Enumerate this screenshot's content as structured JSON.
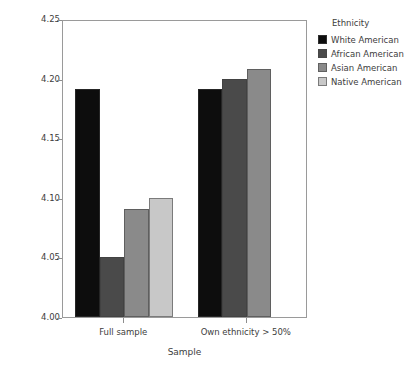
{
  "chart_data": {
    "type": "bar",
    "title": "",
    "xlabel": "Sample",
    "ylabel": "Mean life satisfaction",
    "categories": [
      "Full sample",
      "Own ethnicity > 50%"
    ],
    "ylim": [
      4.0,
      4.25
    ],
    "yticks": [
      "4.00",
      "4.05",
      "4.10",
      "4.15",
      "4.20",
      "4.25"
    ],
    "ytick_values": [
      4.0,
      4.05,
      4.1,
      4.15,
      4.2,
      4.25
    ],
    "grid": false,
    "legend_position": "right",
    "legend_title": "Ethnicity",
    "series": [
      {
        "name": "White American",
        "color": "#0d0d0d",
        "values": [
          4.191,
          4.191
        ]
      },
      {
        "name": "African American",
        "color": "#4a4a4a",
        "values": [
          4.05,
          4.2
        ]
      },
      {
        "name": "Asian American",
        "color": "#8a8a8a",
        "values": [
          4.091,
          4.208
        ]
      },
      {
        "name": "Native American",
        "color": "#c8c8c8",
        "values": [
          4.1,
          null
        ]
      }
    ]
  },
  "axes": {
    "y_title": "Mean life satisfaction",
    "x_title": "Sample",
    "y_ticks": [
      {
        "label": "4.25",
        "value": 4.25
      },
      {
        "label": "4.20",
        "value": 4.2
      },
      {
        "label": "4.15",
        "value": 4.15
      },
      {
        "label": "4.10",
        "value": 4.1
      },
      {
        "label": "4.05",
        "value": 4.05
      },
      {
        "label": "4.00",
        "value": 4.0
      }
    ],
    "x_ticks": [
      {
        "label": "Full sample"
      },
      {
        "label": "Own ethnicity > 50%"
      }
    ]
  },
  "legend": {
    "title": "Ethnicity",
    "items": [
      {
        "label": "White American",
        "color": "#0d0d0d"
      },
      {
        "label": "African American",
        "color": "#4a4a4a"
      },
      {
        "label": "Asian American",
        "color": "#8a8a8a"
      },
      {
        "label": "Native American",
        "color": "#c8c8c8"
      }
    ]
  }
}
